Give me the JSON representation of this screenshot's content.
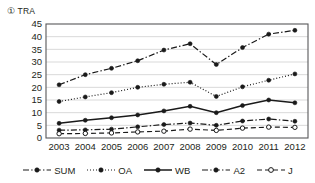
{
  "chart_data": {
    "type": "line",
    "title": "① TRA",
    "xlabel": "",
    "ylabel": "",
    "x": [
      2003,
      2004,
      2005,
      2006,
      2007,
      2008,
      2009,
      2010,
      2011,
      2012
    ],
    "xtick_labels": [
      "2003",
      "2004",
      "2005",
      "2006",
      "2007",
      "2008",
      "2009",
      "2010",
      "2011",
      "2012"
    ],
    "ylim": [
      0,
      45
    ],
    "yticks": [
      0,
      5,
      10,
      15,
      20,
      25,
      30,
      35,
      40,
      45
    ],
    "ytick_labels": [
      "0",
      "5",
      "10",
      "15",
      "20",
      "25",
      "30",
      "35",
      "40",
      "45"
    ],
    "grid": "horizontal",
    "legend_position": "bottom",
    "series": [
      {
        "name": "SUM",
        "values": [
          21.0,
          25.0,
          27.5,
          30.5,
          34.7,
          37.2,
          29.0,
          35.7,
          41.0,
          42.5
        ],
        "line_style": "dash-dot",
        "marker": "filled-circle",
        "color": "#1a1a1a"
      },
      {
        "name": "OA",
        "values": [
          14.4,
          16.2,
          17.9,
          20.0,
          21.2,
          22.0,
          16.4,
          20.2,
          22.8,
          25.3
        ],
        "line_style": "dotted",
        "marker": "filled-circle",
        "color": "#1a1a1a"
      },
      {
        "name": "WB",
        "values": [
          5.8,
          7.0,
          8.0,
          9.1,
          10.7,
          12.5,
          10.0,
          12.8,
          15.0,
          13.9
        ],
        "line_style": "solid",
        "marker": "filled-circle",
        "color": "#1a1a1a"
      },
      {
        "name": "A2",
        "values": [
          3.1,
          3.2,
          3.5,
          4.4,
          5.3,
          5.9,
          5.0,
          6.7,
          7.5,
          6.6
        ],
        "line_style": "dash-dot",
        "marker": "filled-circle",
        "color": "#1a1a1a"
      },
      {
        "name": "J",
        "values": [
          1.7,
          1.8,
          2.0,
          2.4,
          2.7,
          3.5,
          3.0,
          3.9,
          4.3,
          4.2
        ],
        "line_style": "dashed",
        "marker": "open-circle",
        "color": "#1a1a1a"
      }
    ]
  },
  "legend": {
    "items": [
      {
        "label": "SUM"
      },
      {
        "label": "OA"
      },
      {
        "label": "WB"
      },
      {
        "label": "A2"
      },
      {
        "label": "J"
      }
    ]
  }
}
